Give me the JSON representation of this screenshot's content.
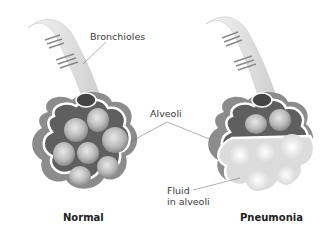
{
  "labels": {
    "bronchioles": "Bronchioles",
    "alveoli": "Alveoli",
    "fluid_line1": "Fluid",
    "fluid_line2": "in alveoli"
  },
  "captions": {
    "normal": "Normal",
    "pneumonia": "Pneumonia"
  },
  "colors": {
    "tissue_dark": "#6e6e6e",
    "tissue_mid": "#9a9a9a",
    "alveolus": "#bdbdbd",
    "fluid": "#dcdcdc",
    "outline": "#ffffff"
  }
}
